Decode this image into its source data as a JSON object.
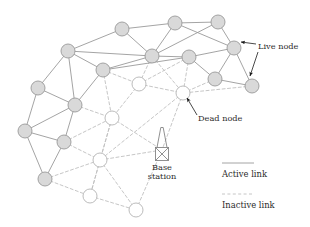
{
  "figure": {
    "type": "network-diagram",
    "title": "",
    "background_color": "#ffffff"
  },
  "style": {
    "live_node_fill": "#d9d9d9",
    "live_node_stroke": "#9a9a9a",
    "dead_node_fill": "#ffffff",
    "dead_node_stroke": "#b4b4b4",
    "active_link_color": "#9a9a9a",
    "inactive_link_color": "#c0c0c0",
    "annotation_color": "#1a1a1a",
    "text_color": "#2b2b2b",
    "node_radius": 7.0,
    "active_link_width": 0.9,
    "inactive_link_width": 0.9,
    "inactive_dash": "3,2.4"
  },
  "nodes": {
    "live": [
      {
        "id": "L1",
        "x": 122,
        "y": 29
      },
      {
        "id": "L2",
        "x": 175,
        "y": 23
      },
      {
        "id": "L3",
        "x": 218,
        "y": 22
      },
      {
        "id": "L4",
        "x": 68,
        "y": 51
      },
      {
        "id": "L5",
        "x": 152,
        "y": 56
      },
      {
        "id": "L6",
        "x": 189,
        "y": 57
      },
      {
        "id": "L7",
        "x": 234,
        "y": 48
      },
      {
        "id": "L8",
        "x": 103,
        "y": 70
      },
      {
        "id": "L9",
        "x": 38,
        "y": 88
      },
      {
        "id": "L10",
        "x": 215,
        "y": 79
      },
      {
        "id": "L11",
        "x": 252,
        "y": 86
      },
      {
        "id": "L12",
        "x": 75,
        "y": 105
      },
      {
        "id": "L13",
        "x": 25,
        "y": 131
      },
      {
        "id": "L14",
        "x": 64,
        "y": 142
      },
      {
        "id": "L15",
        "x": 45,
        "y": 179
      }
    ],
    "dead": [
      {
        "id": "D1",
        "x": 139,
        "y": 84
      },
      {
        "id": "D2",
        "x": 183,
        "y": 93
      },
      {
        "id": "D3",
        "x": 112,
        "y": 118
      },
      {
        "id": "D4",
        "x": 100,
        "y": 160
      },
      {
        "id": "D5",
        "x": 90,
        "y": 196
      },
      {
        "id": "D6",
        "x": 136,
        "y": 210
      }
    ]
  },
  "links": {
    "active": [
      [
        "L1",
        "L2"
      ],
      [
        "L2",
        "L3"
      ],
      [
        "L1",
        "L4"
      ],
      [
        "L1",
        "L5"
      ],
      [
        "L2",
        "L5"
      ],
      [
        "L2",
        "L7"
      ],
      [
        "L3",
        "L7"
      ],
      [
        "L3",
        "L5"
      ],
      [
        "L4",
        "L8"
      ],
      [
        "L4",
        "L9"
      ],
      [
        "L4",
        "L12"
      ],
      [
        "L5",
        "L6"
      ],
      [
        "L5",
        "L8"
      ],
      [
        "L6",
        "L7"
      ],
      [
        "L6",
        "L10"
      ],
      [
        "L7",
        "L10"
      ],
      [
        "L7",
        "L11"
      ],
      [
        "L8",
        "L12"
      ],
      [
        "L9",
        "L12"
      ],
      [
        "L9",
        "L13"
      ],
      [
        "L10",
        "L11"
      ],
      [
        "L12",
        "L13"
      ],
      [
        "L12",
        "L14"
      ],
      [
        "L13",
        "L14"
      ],
      [
        "L13",
        "L15"
      ],
      [
        "L14",
        "L15"
      ],
      [
        "L4",
        "L5"
      ],
      [
        "L6",
        "L8"
      ]
    ],
    "inactive": [
      [
        "L5",
        "D1"
      ],
      [
        "L5",
        "D2"
      ],
      [
        "L6",
        "D2"
      ],
      [
        "L6",
        "D1"
      ],
      [
        "L10",
        "D2"
      ],
      [
        "L11",
        "D2"
      ],
      [
        "D1",
        "D2"
      ],
      [
        "D1",
        "D3"
      ],
      [
        "L8",
        "D1"
      ],
      [
        "L8",
        "D3"
      ],
      [
        "D2",
        "D4"
      ],
      [
        "D3",
        "D4"
      ],
      [
        "L12",
        "D3"
      ],
      [
        "L14",
        "D3"
      ],
      [
        "L14",
        "D4"
      ],
      [
        "L15",
        "D4"
      ],
      [
        "D3",
        "D5"
      ],
      [
        "D4",
        "D5"
      ],
      [
        "D4",
        "D6"
      ],
      [
        "D5",
        "D6"
      ],
      [
        "L15",
        "D5"
      ],
      [
        "D2",
        "BS"
      ],
      [
        "D4",
        "BS"
      ],
      [
        "D6",
        "BS"
      ],
      [
        "D3",
        "BS"
      ]
    ]
  },
  "base_station": {
    "label_line1": "Base",
    "label_line2": "station",
    "x": 162,
    "y": 150,
    "label_x": 162,
    "label_y1": 168,
    "label_y2": 177
  },
  "annotations": [
    {
      "id": "live-node",
      "label": "Live node",
      "text_x": 258,
      "text_y": 47,
      "arrows": [
        {
          "x1": 256,
          "y1": 44,
          "x2": 241,
          "y2": 42
        },
        {
          "x1": 258,
          "y1": 52,
          "x2": 250,
          "y2": 76
        }
      ]
    },
    {
      "id": "dead-node",
      "label": "Dead node",
      "text_x": 198,
      "text_y": 119,
      "arrows": [
        {
          "x1": 197,
          "y1": 115,
          "x2": 187,
          "y2": 98
        }
      ]
    }
  ],
  "legend": {
    "items": [
      {
        "id": "active-link",
        "label": "Active link",
        "style": "solid",
        "line_x1": 222,
        "line_x2": 254,
        "line_y": 163,
        "text_x": 222,
        "text_y": 174
      },
      {
        "id": "inactive-link",
        "label": "Inactive link",
        "style": "dashed",
        "line_x1": 222,
        "line_x2": 254,
        "line_y": 194,
        "text_x": 222,
        "text_y": 205
      }
    ]
  }
}
